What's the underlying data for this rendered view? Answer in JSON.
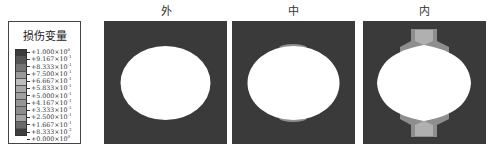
{
  "legend": {
    "title": "损伤变量",
    "colors": [
      "#3c3c3c",
      "#555555",
      "#747474",
      "#9a9a9a",
      "#bdbdbd",
      "#a8a8a8",
      "#a0a0a0",
      "#969696",
      "#8d8d8d",
      "#a3a3a3",
      "#6a6a6a",
      "#3e3e3e"
    ],
    "ticks": [
      {
        "mant": "+1.000×10",
        "exp": "0"
      },
      {
        "mant": "+9.167×10",
        "exp": "-1"
      },
      {
        "mant": "+8.333×10",
        "exp": "-1"
      },
      {
        "mant": "+7.500×10",
        "exp": "-1"
      },
      {
        "mant": "+6.667×10",
        "exp": "-1"
      },
      {
        "mant": "+5.833×10",
        "exp": "-1"
      },
      {
        "mant": "+5.000×10",
        "exp": "-1"
      },
      {
        "mant": "+4.167×10",
        "exp": "-1"
      },
      {
        "mant": "+3.333×10",
        "exp": "-1"
      },
      {
        "mant": "+2.500×10",
        "exp": "-1"
      },
      {
        "mant": "+1.667×10",
        "exp": "-1"
      },
      {
        "mant": "+8.333×10",
        "exp": "-2"
      },
      {
        "mant": "+0.000×10",
        "exp": "0"
      }
    ]
  },
  "panels": [
    {
      "title": "外",
      "damage": "none"
    },
    {
      "title": "中",
      "damage": "small crown and invert zones"
    },
    {
      "title": "内",
      "damage": "large crown and invert zones"
    }
  ],
  "colors": {
    "background_rock": "#3a3a3a",
    "opening": "#ffffff",
    "damage_light": "#b4b4b4",
    "damage_mid": "#8e8e8e"
  }
}
